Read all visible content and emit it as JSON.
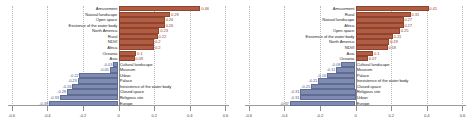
{
  "colors": {
    "positive": "#b25c42",
    "negative": "#7f8bb0",
    "grid": "#b9b9b9",
    "axis": "#8f8f8f"
  },
  "axis": {
    "ticklabels": [
      "-0.6",
      "-0.4",
      "-0.2",
      "0",
      "0.2",
      "0.4",
      "0.6"
    ],
    "tickvalues": [
      -0.6,
      -0.4,
      -0.2,
      0,
      0.2,
      0.4,
      0.6
    ],
    "xmin": -0.62,
    "xmax": 0.62
  },
  "chart_data": [
    {
      "type": "bar",
      "orientation": "horizontal",
      "title": "",
      "xlabel": "",
      "ylabel": "",
      "xlim": [
        -0.62,
        0.62
      ],
      "grid": true,
      "legend_position": "none",
      "categories": [
        "Amusement",
        "Natural landscape",
        "Open space",
        "Existence of the water body",
        "North America",
        "Rural",
        "NDVI",
        "Africa",
        "Oceania",
        "Asia",
        "Cultural landscape",
        "Museum",
        "Urban",
        "Palace",
        "Inexistence of the water body",
        "Closed space",
        "Religious site",
        "Europe"
      ],
      "values": [
        0.46,
        0.29,
        0.26,
        0.26,
        0.23,
        0.22,
        0.2,
        0.2,
        0.1,
        0.09,
        -0.03,
        -0.05,
        -0.22,
        -0.23,
        -0.26,
        -0.29,
        -0.33,
        -0.39
      ],
      "labels": [
        "0.46",
        "0.29",
        "0.26",
        "0.26",
        "0.23",
        "0.22",
        "0.2",
        "0.2",
        "0.1",
        "0.09",
        "-0.03",
        "-0.05",
        "-0.22",
        "-0.23",
        "-0.26",
        "-0.29",
        "-0.33",
        "-0.39"
      ]
    },
    {
      "type": "bar",
      "orientation": "horizontal",
      "title": "",
      "xlabel": "",
      "ylabel": "",
      "xlim": [
        -0.62,
        0.62
      ],
      "grid": true,
      "legend_position": "none",
      "categories": [
        "Amusement",
        "Rural",
        "Natural landscape",
        "Africa",
        "Open space",
        "Existence of the water body",
        "North America",
        "NDVI",
        "Asia",
        "Oceania",
        "Cultural landscape",
        "Museum",
        "Palace",
        "Inexistence of the water body",
        "Closed space",
        "Religious site",
        "Urban",
        "Europe"
      ],
      "values": [
        0.41,
        0.31,
        0.27,
        0.27,
        0.25,
        0.21,
        0.19,
        0.18,
        0.1,
        0.07,
        -0.08,
        -0.11,
        -0.16,
        -0.21,
        -0.25,
        -0.31,
        -0.31,
        -0.37
      ],
      "labels": [
        "0.41",
        "0.31",
        "0.27",
        "0.27",
        "0.25",
        "0.21",
        "0.19",
        "0.18",
        "0.1",
        "0.07",
        "-0.08",
        "-0.11",
        "-0.16",
        "-0.21",
        "-0.25",
        "-0.31",
        "-0.31",
        "-0.37"
      ]
    }
  ]
}
